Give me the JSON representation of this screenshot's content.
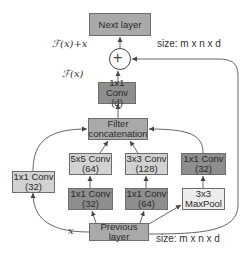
{
  "nodes": {
    "next_layer": {
      "line1": "Next layer"
    },
    "conv_d": {
      "line1": "1x1 Conv",
      "line2": "(d)"
    },
    "filter_concat": {
      "line1": "Filter",
      "line2": "concatenation"
    },
    "left_conv": {
      "line1": "1x1 Conv",
      "line2": "(32)"
    },
    "conv5x5": {
      "line1": "5x5 Conv",
      "line2": "(64)"
    },
    "conv3x3": {
      "line1": "3x3 Conv",
      "line2": "(128)"
    },
    "right_conv": {
      "line1": "1x1 Conv",
      "line2": "(32)"
    },
    "reduce5": {
      "line1": "1x1 Conv",
      "line2": "(32)"
    },
    "reduce3": {
      "line1": "1x1 Conv",
      "line2": "(64)"
    },
    "maxpool": {
      "line1": "3x3",
      "line2": "MaxPool"
    },
    "previous_layer": {
      "line1": "Previous layer"
    }
  },
  "labels": {
    "fx_plus_x": "ℱ(x)+x",
    "fx": "ℱ(x)",
    "x": "x",
    "size_top": "size: m x n x d",
    "size_bottom": "size: m x n x d",
    "add_symbol": "+"
  },
  "colors": {
    "mid_gray": "#a9a9a9",
    "dark_gray": "#8e8e8e",
    "light_gray": "#d2d2d2",
    "pale_gray": "#ececec",
    "line": "#555555"
  }
}
